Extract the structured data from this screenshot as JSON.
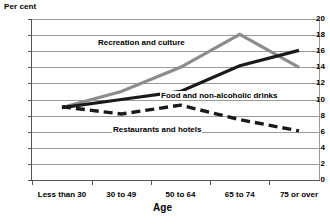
{
  "chart_data": {
    "type": "line",
    "title": "",
    "subtitle": "",
    "xlabel": "Age",
    "ylabel": "Per cent",
    "unit_label": "Per cent",
    "categories": [
      "Less than 30",
      "30 to 49",
      "50 to 64",
      "65 to 74",
      "75 or over"
    ],
    "ylim": [
      0,
      20
    ],
    "ytick_step": 2,
    "yticks": [
      "20",
      "18",
      "16",
      "14",
      "12",
      "10",
      "8",
      "6",
      "4",
      "2",
      "0"
    ],
    "ytick_values": [
      20,
      18,
      16,
      14,
      12,
      10,
      8,
      6,
      4,
      2,
      0
    ],
    "grid": true,
    "legend_position": "inline-annotations",
    "series": [
      {
        "name": "Recreation and culture",
        "values": [
          9.0,
          11.0,
          14.0,
          18.1,
          14.0
        ],
        "color": "#8c8c8c",
        "style": "solid",
        "width": 3.2
      },
      {
        "name": "Food and non-alcoholic drinks",
        "values": [
          9.0,
          10.0,
          11.0,
          14.2,
          16.1
        ],
        "color": "#1a1a1a",
        "style": "solid",
        "width": 3.2
      },
      {
        "name": "Restaurants and hotels",
        "values": [
          9.1,
          8.2,
          9.3,
          7.5,
          6.1
        ],
        "color": "#1a1a1a",
        "style": "dashed",
        "width": 3.4
      }
    ],
    "annotations": [
      {
        "text": "Recreation and culture",
        "series": "Recreation and culture"
      },
      {
        "text": "Food and non-alcoholic drinks",
        "series": "Food and non-alcoholic drinks"
      },
      {
        "text": "Restaurants and hotels",
        "series": "Restaurants and hotels"
      }
    ],
    "colors": {
      "recreation_and_culture": "#8c8c8c",
      "food_and_non_alcoholic_drinks": "#1a1a1a",
      "restaurants_and_hotels": "#1a1a1a",
      "gridline": "#9a9a9a",
      "axis": "#555555",
      "background": "#ffffff"
    }
  }
}
